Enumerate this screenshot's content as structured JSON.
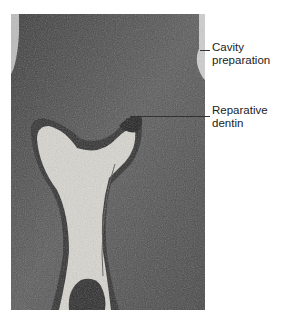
{
  "figure": {
    "type": "grayscale histological micrograph"
  },
  "labels": [
    {
      "id": "cavity",
      "line1": "Cavity",
      "line2": "preparation"
    },
    {
      "id": "reparative",
      "line1": "Reparative",
      "line2": "dentin"
    }
  ]
}
